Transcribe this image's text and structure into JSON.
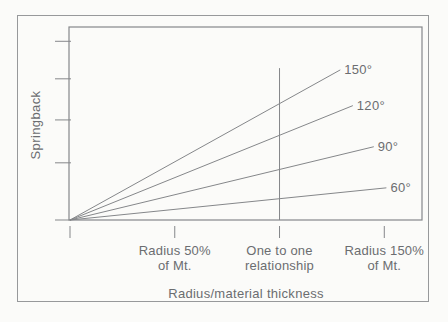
{
  "figure": {
    "background": "#fbfbf9",
    "frame_color": "#97999b",
    "line_color": "#85878a",
    "text_color": "#6b6d70"
  },
  "chart_data": {
    "type": "line",
    "xlabel": "Radius/material thickness",
    "ylabel": "Springback",
    "x_unit": "radius as percent of material thickness",
    "y_unit": "springback (unlabeled, arbitrary units)",
    "xlim": [
      0,
      168
    ],
    "ylim": [
      0,
      108
    ],
    "grid": false,
    "legend_position": "labels at right end of each line",
    "series": [
      {
        "name": "150°",
        "bend_angle_deg": 150,
        "x": [
          0,
          129
        ],
        "y": [
          0,
          84
        ]
      },
      {
        "name": "120°",
        "bend_angle_deg": 120,
        "x": [
          0,
          135
        ],
        "y": [
          0,
          64
        ]
      },
      {
        "name": "90°",
        "bend_angle_deg": 90,
        "x": [
          0,
          145
        ],
        "y": [
          0,
          41
        ]
      },
      {
        "name": "60°",
        "bend_angle_deg": 60,
        "x": [
          0,
          151
        ],
        "y": [
          0,
          18
        ]
      }
    ],
    "reference_line": {
      "x": 100,
      "y_from": 0,
      "y_to": 85
    },
    "x_ticks": [
      0,
      50,
      100,
      150
    ],
    "y_ticks": [
      0,
      32,
      56,
      79,
      100
    ],
    "x_tick_labels": [
      {
        "x": 50,
        "line1": "Radius 50%",
        "line2": "of Mt."
      },
      {
        "x": 100,
        "line1": "One to one",
        "line2": "relationship"
      },
      {
        "x": 150,
        "line1": "Radius 150%",
        "line2": "of Mt."
      }
    ]
  }
}
